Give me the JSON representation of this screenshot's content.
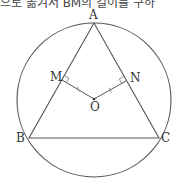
{
  "caption_fragment": "으로 옮겨서 BM의 길이를 구하",
  "diagram": {
    "type": "geometry",
    "points": {
      "A": {
        "label": "A",
        "x": 94,
        "y": 23
      },
      "B": {
        "label": "B",
        "x": 29,
        "y": 138
      },
      "C": {
        "label": "C",
        "x": 159,
        "y": 138
      },
      "M": {
        "label": "M",
        "x": 62,
        "y": 80
      },
      "N": {
        "label": "N",
        "x": 126,
        "y": 81
      },
      "O": {
        "label": "O",
        "x": 94,
        "y": 99
      }
    },
    "circle": {
      "cx": 94,
      "cy": 100,
      "r": 77
    },
    "stroke_color": "#555555"
  }
}
